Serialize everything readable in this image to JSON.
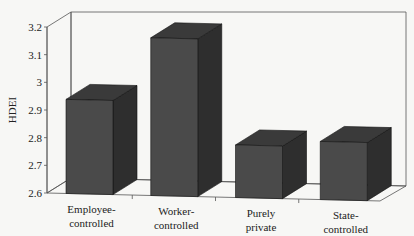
{
  "chart_data": {
    "type": "bar",
    "style": "3d",
    "title": "",
    "xlabel": "",
    "ylabel": "HDEI",
    "ylim": [
      2.6,
      3.2
    ],
    "yticks": [
      2.6,
      2.7,
      2.8,
      2.9,
      3.0,
      3.1,
      3.2
    ],
    "ytick_labels": [
      "2.6",
      "2.7",
      "2.8",
      "2.9",
      "3",
      "3.1",
      "3.2"
    ],
    "categories": [
      [
        "Employee-",
        "controlled"
      ],
      [
        "Worker-",
        "controlled"
      ],
      [
        "Purely",
        "private"
      ],
      [
        "State-",
        "controlled"
      ]
    ],
    "category_names": [
      "Employee-controlled",
      "Worker-controlled",
      "Purely private",
      "State-controlled"
    ],
    "values": [
      2.94,
      3.17,
      2.79,
      2.81
    ],
    "grid": false,
    "legend": null,
    "colors": {
      "bar_front": "#4a4a4a",
      "bar_top": "#3a3a3a",
      "bar_side": "#2e2e2e",
      "background": "#f7f7f5",
      "axis": "#555555"
    }
  }
}
